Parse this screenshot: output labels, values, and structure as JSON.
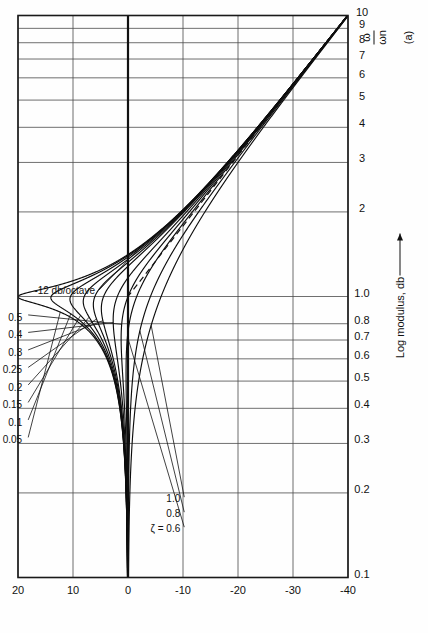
{
  "figure": {
    "caption": "(a)",
    "annotation_slope": "-12 db/octave",
    "y_axis_title": "Log modulus, db",
    "x_axis_title_num": "ω",
    "x_axis_title_den": "ωn"
  },
  "chart_data": {
    "type": "line",
    "title": "",
    "subtitle": "",
    "xlabel": "ω/ωn",
    "ylabel": "Log modulus, db",
    "xscale": "log",
    "yscale": "linear",
    "xlim": [
      0.1,
      10
    ],
    "ylim": [
      -40,
      20
    ],
    "grid": true,
    "legend": "inline-labels",
    "x_tick_labels": [
      "0.1",
      "0.2",
      "0.3",
      "0.4",
      "0.5",
      "0.6",
      "0.7",
      "0.8",
      "1.0",
      "2",
      "3",
      "4",
      "5",
      "6",
      "7",
      "8",
      "9",
      "10"
    ],
    "x_tick_values": [
      0.1,
      0.2,
      0.3,
      0.4,
      0.5,
      0.6,
      0.7,
      0.8,
      1.0,
      2,
      3,
      4,
      5,
      6,
      7,
      8,
      9,
      10
    ],
    "y_tick_labels": [
      "20",
      "10",
      "0",
      "-10",
      "-20",
      "-30",
      "-40"
    ],
    "y_tick_values": [
      20,
      10,
      0,
      -10,
      -20,
      -30,
      -40
    ],
    "formula": "M(w) = -20*log10( sqrt( (1-w^2)^2 + (2*zeta*w)^2 ) )",
    "annotations": [
      {
        "text": "-12 db/octave",
        "x": 1.55,
        "y": -3.0
      },
      {
        "text": "(a)",
        "x": 1.0,
        "y": -47
      }
    ],
    "series": [
      {
        "name": "ζ = 0.05",
        "zeta": 0.05,
        "label": "ζ = 0.05",
        "label_group": "upper",
        "peak_db": 20.0
      },
      {
        "name": "0.1",
        "zeta": 0.1,
        "label": "0.1",
        "label_group": "upper",
        "peak_db": 14.0
      },
      {
        "name": "0.15",
        "zeta": 0.15,
        "label": "0.15",
        "label_group": "upper",
        "peak_db": 10.4
      },
      {
        "name": "0.2",
        "zeta": 0.2,
        "label": "0.2",
        "label_group": "upper",
        "peak_db": 8.1
      },
      {
        "name": "0.25",
        "zeta": 0.25,
        "label": "0.25",
        "label_group": "upper",
        "peak_db": 6.3
      },
      {
        "name": "0.3",
        "zeta": 0.3,
        "label": "0.3",
        "label_group": "upper",
        "peak_db": 4.8
      },
      {
        "name": "0.4",
        "zeta": 0.4,
        "label": "0.4",
        "label_group": "upper",
        "peak_db": 2.7
      },
      {
        "name": "0.5",
        "zeta": 0.5,
        "label": "0.5",
        "label_group": "upper",
        "peak_db": 1.2
      },
      {
        "name": "ζ = 0.6",
        "zeta": 0.6,
        "label": "ζ = 0.6",
        "label_group": "lower",
        "peak_db": 0.35
      },
      {
        "name": "0.8",
        "zeta": 0.8,
        "label": "0.8",
        "label_group": "lower",
        "peak_db": 0.0
      },
      {
        "name": "1.0",
        "zeta": 1.0,
        "label": "1.0",
        "label_group": "lower",
        "peak_db": 0.0
      }
    ],
    "asymptote": {
      "name": "-12 db/octave high-frequency asymptote",
      "slope_db_per_octave": -12,
      "breakpoint_x": 1.0,
      "breakpoint_y": 0,
      "style": "dashed"
    }
  }
}
